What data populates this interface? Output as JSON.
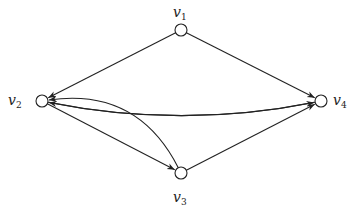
{
  "diagram": {
    "type": "directed-graph",
    "stroke_color": "#222222",
    "node_fill": "#ffffff",
    "node_radius": 6,
    "nodes": [
      {
        "id": "v1",
        "label": "v",
        "sub": "1",
        "x": 181,
        "y": 30,
        "label_x": 173,
        "label_y": 5
      },
      {
        "id": "v2",
        "label": "v",
        "sub": "2",
        "x": 42,
        "y": 101,
        "label_x": 8,
        "label_y": 93
      },
      {
        "id": "v3",
        "label": "v",
        "sub": "3",
        "x": 181,
        "y": 173,
        "label_x": 173,
        "label_y": 190
      },
      {
        "id": "v4",
        "label": "v",
        "sub": "4",
        "x": 321,
        "y": 101,
        "label_x": 333,
        "label_y": 93
      }
    ],
    "edges": [
      {
        "from": "v1",
        "to": "v2",
        "shape": "straight"
      },
      {
        "from": "v1",
        "to": "v4",
        "shape": "straight"
      },
      {
        "from": "v4",
        "to": "v2",
        "shape": "curved",
        "bend": -14
      },
      {
        "from": "v2",
        "to": "v4",
        "shape": "curved",
        "bend": 14
      },
      {
        "from": "v2",
        "to": "v3",
        "shape": "straight"
      },
      {
        "from": "v3",
        "to": "v2",
        "shape": "curved",
        "bend": 28
      },
      {
        "from": "v3",
        "to": "v4",
        "shape": "straight"
      }
    ]
  }
}
